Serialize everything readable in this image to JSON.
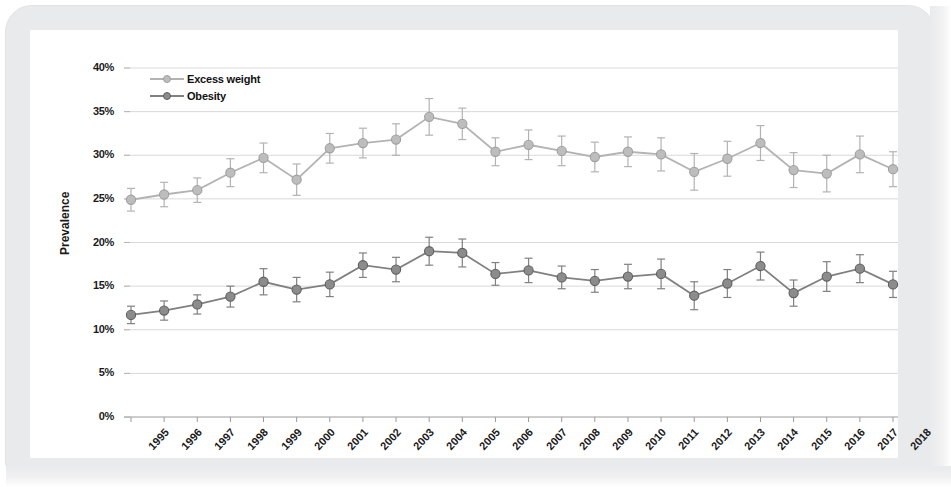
{
  "chart_data": {
    "type": "line",
    "title": "",
    "xlabel": "",
    "ylabel": "Prevalence",
    "ylim": [
      0,
      40
    ],
    "yticks": [
      "0%",
      "5%",
      "10%",
      "15%",
      "20%",
      "25%",
      "30%",
      "35%",
      "40%"
    ],
    "ytick_values": [
      0,
      5,
      10,
      15,
      20,
      25,
      30,
      35,
      40
    ],
    "grid": true,
    "legend_position": "top-left",
    "categories": [
      "1995",
      "1996",
      "1997",
      "1998",
      "1999",
      "2000",
      "2001",
      "2002",
      "2003",
      "2004",
      "2005",
      "2006",
      "2007",
      "2008",
      "2009",
      "2010",
      "2011",
      "2012",
      "2013",
      "2014",
      "2015",
      "2016",
      "2017",
      "2018"
    ],
    "series": [
      {
        "name": "Excess weight",
        "color": "#b3b3b3",
        "marker": "circle",
        "values": [
          24.9,
          25.5,
          26.0,
          28.0,
          29.7,
          27.2,
          30.8,
          31.4,
          31.8,
          34.4,
          33.6,
          30.4,
          31.2,
          30.5,
          29.8,
          30.4,
          30.1,
          28.1,
          29.6,
          31.4,
          28.3,
          27.9,
          30.1,
          28.4
        ],
        "error_low": [
          23.6,
          24.1,
          24.6,
          26.4,
          28.0,
          25.4,
          29.1,
          29.7,
          30.0,
          32.3,
          31.8,
          28.8,
          29.5,
          28.8,
          28.1,
          28.7,
          28.2,
          26.0,
          27.6,
          29.4,
          26.3,
          25.8,
          28.0,
          26.4
        ],
        "error_high": [
          26.2,
          26.9,
          27.4,
          29.6,
          31.4,
          29.0,
          32.5,
          33.1,
          33.6,
          36.5,
          35.4,
          32.0,
          32.9,
          32.2,
          31.5,
          32.1,
          32.0,
          30.2,
          31.6,
          33.4,
          30.3,
          30.0,
          32.2,
          30.4
        ]
      },
      {
        "name": "Obesity",
        "color": "#808080",
        "marker": "circle",
        "values": [
          11.7,
          12.2,
          12.9,
          13.8,
          15.5,
          14.6,
          15.2,
          17.4,
          16.9,
          19.0,
          18.8,
          16.4,
          16.8,
          16.0,
          15.6,
          16.1,
          16.4,
          13.9,
          15.3,
          17.3,
          14.2,
          16.1,
          17.0,
          15.2
        ],
        "error_low": [
          10.7,
          11.1,
          11.8,
          12.6,
          14.0,
          13.2,
          13.8,
          16.0,
          15.5,
          17.4,
          17.2,
          15.1,
          15.4,
          14.7,
          14.3,
          14.7,
          14.7,
          12.3,
          13.7,
          15.7,
          12.7,
          14.4,
          15.4,
          13.7
        ],
        "error_high": [
          12.7,
          13.3,
          14.0,
          15.0,
          17.0,
          16.0,
          16.6,
          18.8,
          18.3,
          20.6,
          20.4,
          17.7,
          18.2,
          17.3,
          16.9,
          17.5,
          18.1,
          15.5,
          16.9,
          18.9,
          15.7,
          17.8,
          18.6,
          16.7
        ]
      }
    ]
  },
  "axis": {
    "y_title": "Prevalence"
  },
  "legend": {
    "items": [
      {
        "label": "Excess weight",
        "color": "#b3b3b3"
      },
      {
        "label": "Obesity",
        "color": "#808080"
      }
    ]
  }
}
